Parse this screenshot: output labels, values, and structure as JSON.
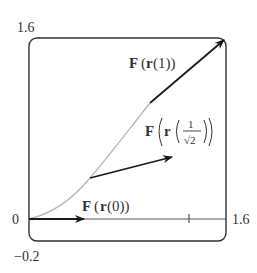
{
  "figure": {
    "frame": {
      "x0": 29,
      "y0": 38,
      "x1": 226,
      "y1": 241,
      "radius": 8
    },
    "axis_labels": {
      "y_max": "1.6",
      "y_min": "−0.2",
      "x_min": "0",
      "x_max": "1.6",
      "x_tick": "1"
    },
    "curve": {
      "description": "path r(t) drawn in light gray from origin",
      "color": "#b5b5b5"
    },
    "vectors": [
      {
        "name": "F(r(0))",
        "label_parts": [
          "F",
          "(",
          "r",
          "(0))"
        ],
        "color": "#1a1a1a"
      },
      {
        "name": "F(r(1/√2))",
        "label_parts": [
          "F",
          "r",
          "1",
          "√2"
        ],
        "color": "#1a1a1a"
      },
      {
        "name": "F(r(1))",
        "label_parts": [
          "F",
          "(",
          "r",
          "(1))"
        ],
        "color": "#1a1a1a"
      }
    ],
    "labels": {
      "f_r0_F": "F",
      "f_r0_rest_open": "(",
      "f_r0_r": "r",
      "f_r0_rest": "(0))",
      "f_r1_F": "F",
      "f_r1_open": "(",
      "f_r1_r": "r",
      "f_r1_rest": "(1))",
      "f_rm_F": "F",
      "f_rm_r": "r",
      "f_rm_num": "1",
      "f_rm_den": "√2"
    }
  }
}
